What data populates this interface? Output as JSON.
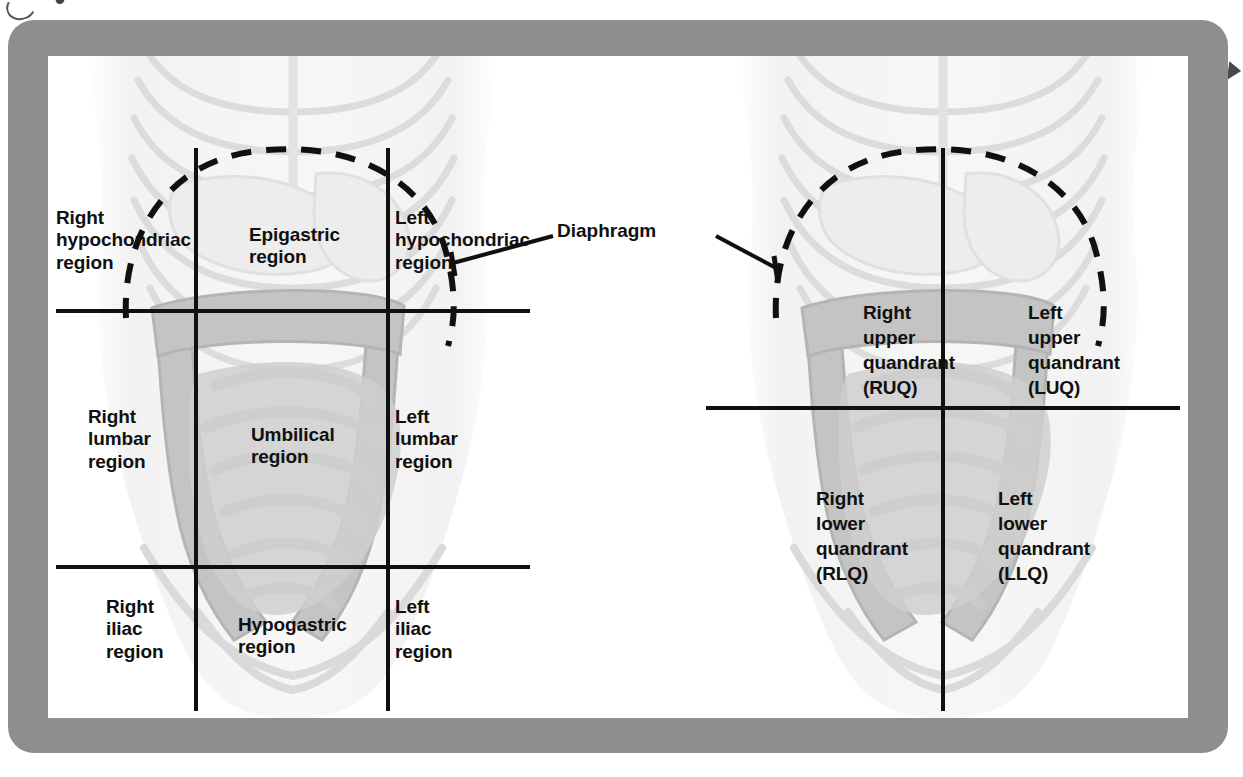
{
  "figure": {
    "frame_color": "#8e8e8e",
    "canvas_color": "#ffffff",
    "line_color": "#101010",
    "illustration_tone_light": "#e9e9e9",
    "illustration_tone_mid": "#c9c9c9",
    "illustration_tone_dark": "#b0b0b0"
  },
  "callouts": {
    "diaphragm": "Diaphragm"
  },
  "regions_panel": {
    "name": "nine-region-scheme",
    "labels": {
      "right_hypochondriac": "Right\nhypochondriac\nregion",
      "epigastric": "Epigastric\nregion",
      "left_hypochondriac": "Left\nhypochondriac\nregion",
      "right_lumbar": "Right\nlumbar\nregion",
      "umbilical": "Umbilical\nregion",
      "left_lumbar": "Left\nlumbar\nregion",
      "right_iliac": "Right\niliac\nregion",
      "hypogastric": "Hypogastric\nregion",
      "left_iliac": "Left\niliac\nregion"
    }
  },
  "quadrants_panel": {
    "name": "four-quadrant-scheme",
    "labels": {
      "right_upper": "Right\nupper\nquandrant\n(RUQ)",
      "left_upper": "Left\nupper\nquandrant\n(LUQ)",
      "right_lower": "Right\nlower\nquandrant\n(RLQ)",
      "left_lower": "Left\nlower\nquandrant\n(LLQ)"
    }
  }
}
